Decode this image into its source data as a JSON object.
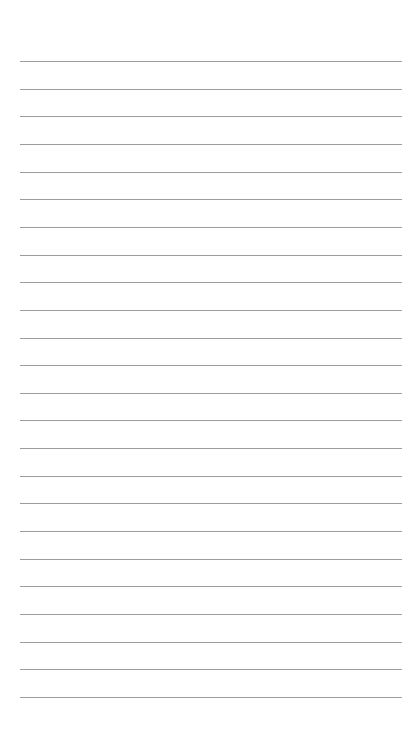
{
  "page": {
    "type": "lined-paper",
    "background_color": "#ffffff",
    "rule_color": "#9c9c9c",
    "rule_count": 24,
    "first_rule_y": 61,
    "rule_spacing": 27.65,
    "rule_left": 20,
    "rule_width": 382
  }
}
